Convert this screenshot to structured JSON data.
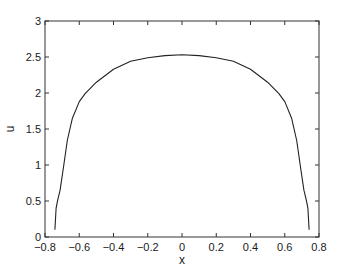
{
  "chart_data": {
    "type": "line",
    "title": "",
    "xlabel": "x",
    "ylabel": "u",
    "xlim": [
      -0.8,
      0.8
    ],
    "ylim": [
      0,
      3
    ],
    "xticks": [
      -0.8,
      -0.6,
      -0.4,
      -0.2,
      0,
      0.2,
      0.4,
      0.6,
      0.8
    ],
    "xtick_labels": [
      "−0.8",
      "−0.6",
      "−0.4",
      "−0.2",
      "0",
      "0.2",
      "0.4",
      "0.6",
      "0.8"
    ],
    "yticks": [
      0,
      0.5,
      1,
      1.5,
      2,
      2.5,
      3
    ],
    "ytick_labels": [
      "0",
      "0.5",
      "1",
      "1.5",
      "2",
      "2.5",
      "3"
    ],
    "grid": false,
    "legend": null,
    "box": true,
    "series": [
      {
        "name": "u(x)",
        "color": "#222222",
        "x": [
          -0.742,
          -0.735,
          -0.725,
          -0.712,
          -0.69,
          -0.67,
          -0.64,
          -0.6,
          -0.566,
          -0.5,
          -0.4,
          -0.3,
          -0.2,
          -0.1,
          0,
          0.1,
          0.2,
          0.3,
          0.4,
          0.5,
          0.566,
          0.6,
          0.64,
          0.67,
          0.69,
          0.712,
          0.725,
          0.735,
          0.742
        ],
        "y": [
          0.1,
          0.4,
          0.52,
          0.65,
          1.0,
          1.34,
          1.65,
          1.88,
          1.99,
          2.15,
          2.33,
          2.44,
          2.49,
          2.52,
          2.53,
          2.52,
          2.49,
          2.44,
          2.33,
          2.15,
          1.99,
          1.88,
          1.65,
          1.34,
          1.0,
          0.65,
          0.52,
          0.4,
          0.1
        ]
      }
    ]
  },
  "axes_box": {
    "left": 45,
    "top": 21,
    "right": 319,
    "bottom": 237
  }
}
